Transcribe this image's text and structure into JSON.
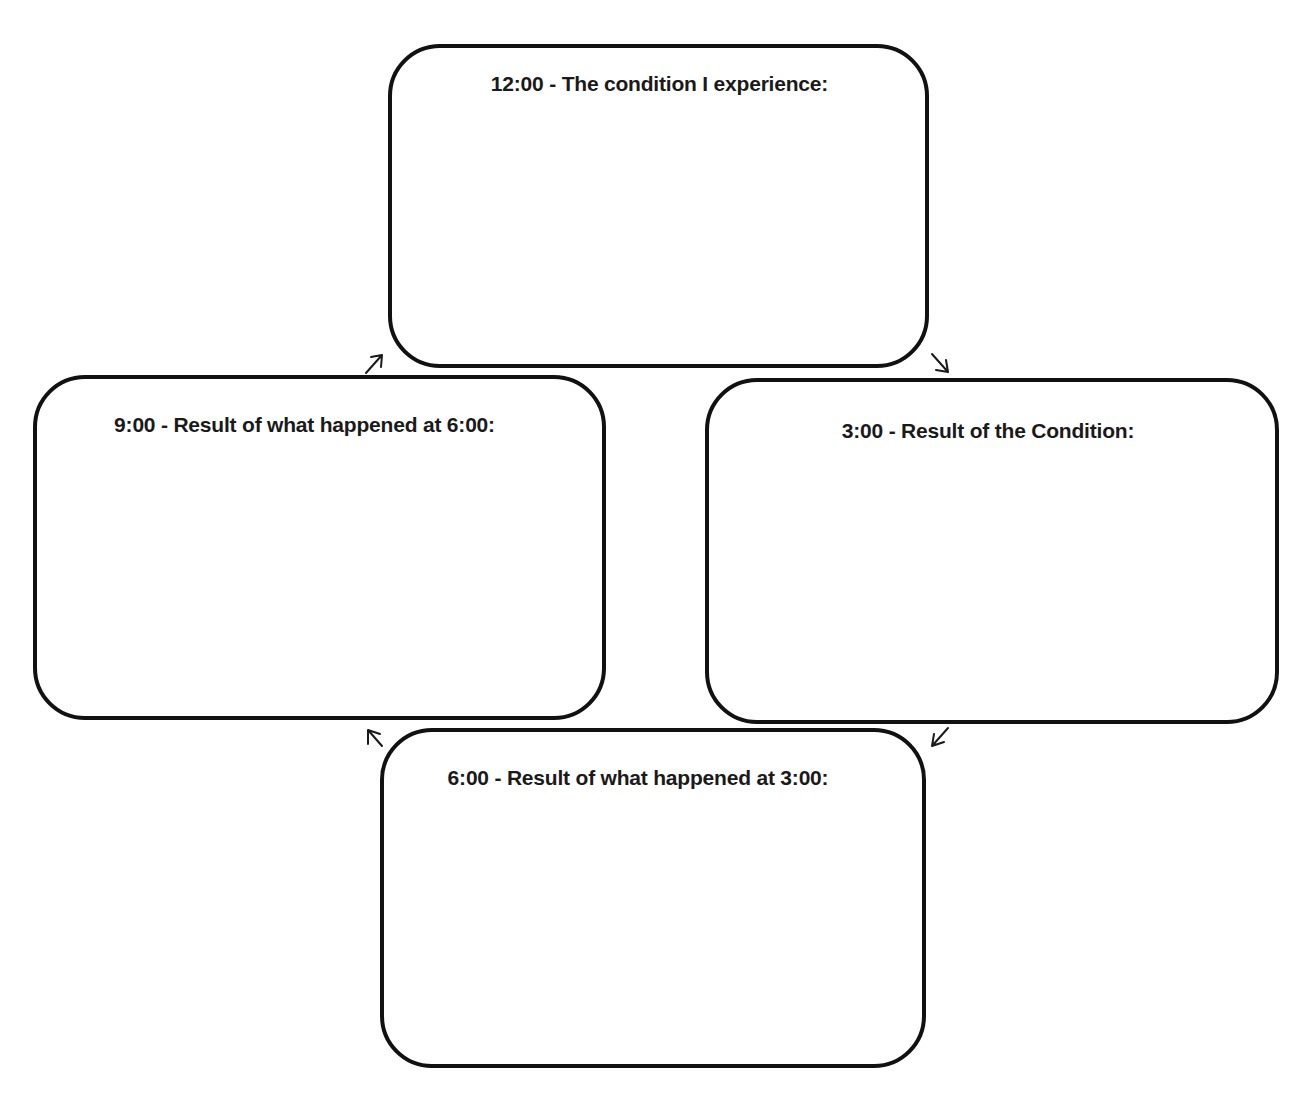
{
  "diagram": {
    "type": "cycle",
    "direction": "clockwise",
    "colors": {
      "stroke": "#111111",
      "text": "#1a1a1a",
      "background": "#ffffff"
    },
    "boxes": [
      {
        "id": "12",
        "position": "top",
        "label": "12:00 - The condition I experience:",
        "content": ""
      },
      {
        "id": "3",
        "position": "right",
        "label": "3:00 - Result of the Condition:",
        "content": ""
      },
      {
        "id": "6",
        "position": "bottom",
        "label": "6:00 - Result of what happened at 3:00:",
        "content": ""
      },
      {
        "id": "9",
        "position": "left",
        "label": "9:00 - Result of what happened at 6:00:",
        "content": ""
      }
    ],
    "arrows": [
      {
        "from": "12",
        "to": "3",
        "icon": "arrow-down-right-icon"
      },
      {
        "from": "3",
        "to": "6",
        "icon": "arrow-down-left-icon"
      },
      {
        "from": "6",
        "to": "9",
        "icon": "arrow-up-left-icon"
      },
      {
        "from": "9",
        "to": "12",
        "icon": "arrow-up-right-icon"
      }
    ]
  }
}
